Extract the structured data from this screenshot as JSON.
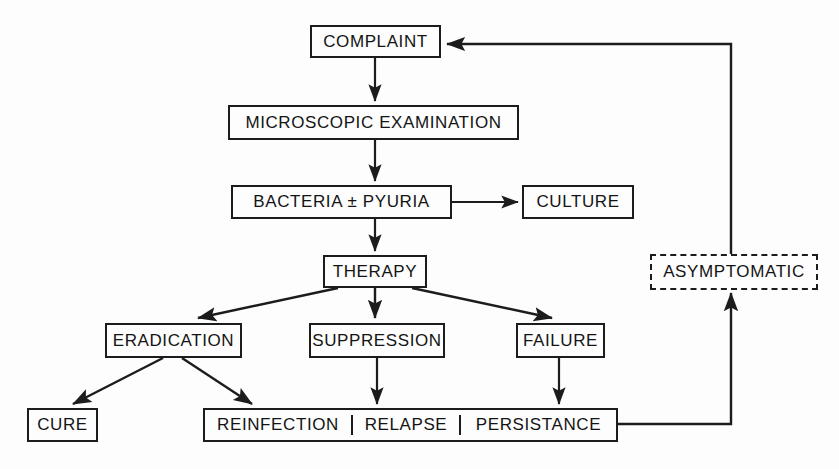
{
  "diagram": {
    "background": "#fdfdfd",
    "line_color": "#1c1c1c",
    "text_color": "#141414",
    "nodes": {
      "complaint": "COMPLAINT",
      "microscopic_examination": "MICROSCOPIC  EXAMINATION",
      "bacteria_pyuria": "BACTERIA ± PYURIA",
      "culture": "CULTURE",
      "therapy": "THERAPY",
      "eradication": "ERADICATION",
      "suppression": "SUPPRESSION",
      "failure": "FAILURE",
      "cure": "CURE",
      "reinfection": "REINFECTION",
      "relapse": "RELAPSE",
      "persistance": "PERSISTANCE",
      "asymptomatic": "ASYMPTOMATIC"
    },
    "edges": [
      {
        "from": "complaint",
        "to": "microscopic_examination",
        "style": "solid"
      },
      {
        "from": "microscopic_examination",
        "to": "bacteria_pyuria",
        "style": "solid"
      },
      {
        "from": "bacteria_pyuria",
        "to": "culture",
        "style": "solid"
      },
      {
        "from": "bacteria_pyuria",
        "to": "therapy",
        "style": "solid"
      },
      {
        "from": "therapy",
        "to": "eradication",
        "style": "solid"
      },
      {
        "from": "therapy",
        "to": "suppression",
        "style": "solid"
      },
      {
        "from": "therapy",
        "to": "failure",
        "style": "solid"
      },
      {
        "from": "eradication",
        "to": "cure",
        "style": "solid"
      },
      {
        "from": "eradication",
        "to": "reinfection",
        "style": "solid"
      },
      {
        "from": "suppression",
        "to": "relapse",
        "style": "solid"
      },
      {
        "from": "failure",
        "to": "persistance",
        "style": "solid"
      },
      {
        "from": "persistance",
        "to": "asymptomatic",
        "style": "solid"
      },
      {
        "from": "asymptomatic",
        "to": "complaint",
        "style": "solid"
      }
    ]
  }
}
